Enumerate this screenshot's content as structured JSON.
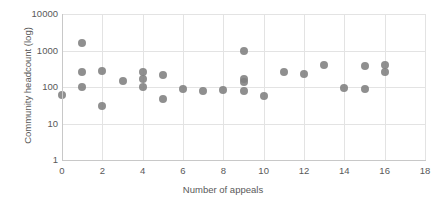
{
  "chart_data": {
    "type": "scatter",
    "title": "",
    "xlabel": "Number of appeals",
    "ylabel": "Community headcount (log)",
    "xlim": [
      0,
      18
    ],
    "ylim": [
      1,
      10000
    ],
    "yscale": "log",
    "grid": true,
    "legend": "none",
    "marker_color": "#808080",
    "xticks": [
      "0",
      "2",
      "4",
      "6",
      "8",
      "10",
      "12",
      "14",
      "16",
      "18"
    ],
    "xtick_values": [
      0,
      2,
      4,
      6,
      8,
      10,
      12,
      14,
      16,
      18
    ],
    "yticks": [
      "1",
      "10",
      "100",
      "1000",
      "10000"
    ],
    "ytick_values": [
      1,
      10,
      100,
      1000,
      10000
    ],
    "points": [
      {
        "x": 0,
        "y": 60
      },
      {
        "x": 1,
        "y": 1600
      },
      {
        "x": 1,
        "y": 250
      },
      {
        "x": 1,
        "y": 100
      },
      {
        "x": 2,
        "y": 270
      },
      {
        "x": 2,
        "y": 30
      },
      {
        "x": 3,
        "y": 150
      },
      {
        "x": 4,
        "y": 250
      },
      {
        "x": 4,
        "y": 170
      },
      {
        "x": 4,
        "y": 100
      },
      {
        "x": 5,
        "y": 210
      },
      {
        "x": 5,
        "y": 48
      },
      {
        "x": 6,
        "y": 90
      },
      {
        "x": 7,
        "y": 80
      },
      {
        "x": 8,
        "y": 85
      },
      {
        "x": 9,
        "y": 1000
      },
      {
        "x": 9,
        "y": 170
      },
      {
        "x": 9,
        "y": 140
      },
      {
        "x": 9,
        "y": 80
      },
      {
        "x": 10,
        "y": 58
      },
      {
        "x": 11,
        "y": 250
      },
      {
        "x": 12,
        "y": 230
      },
      {
        "x": 13,
        "y": 400
      },
      {
        "x": 14,
        "y": 95
      },
      {
        "x": 15,
        "y": 90
      },
      {
        "x": 15,
        "y": 380
      },
      {
        "x": 16,
        "y": 400
      },
      {
        "x": 16,
        "y": 250
      }
    ]
  }
}
